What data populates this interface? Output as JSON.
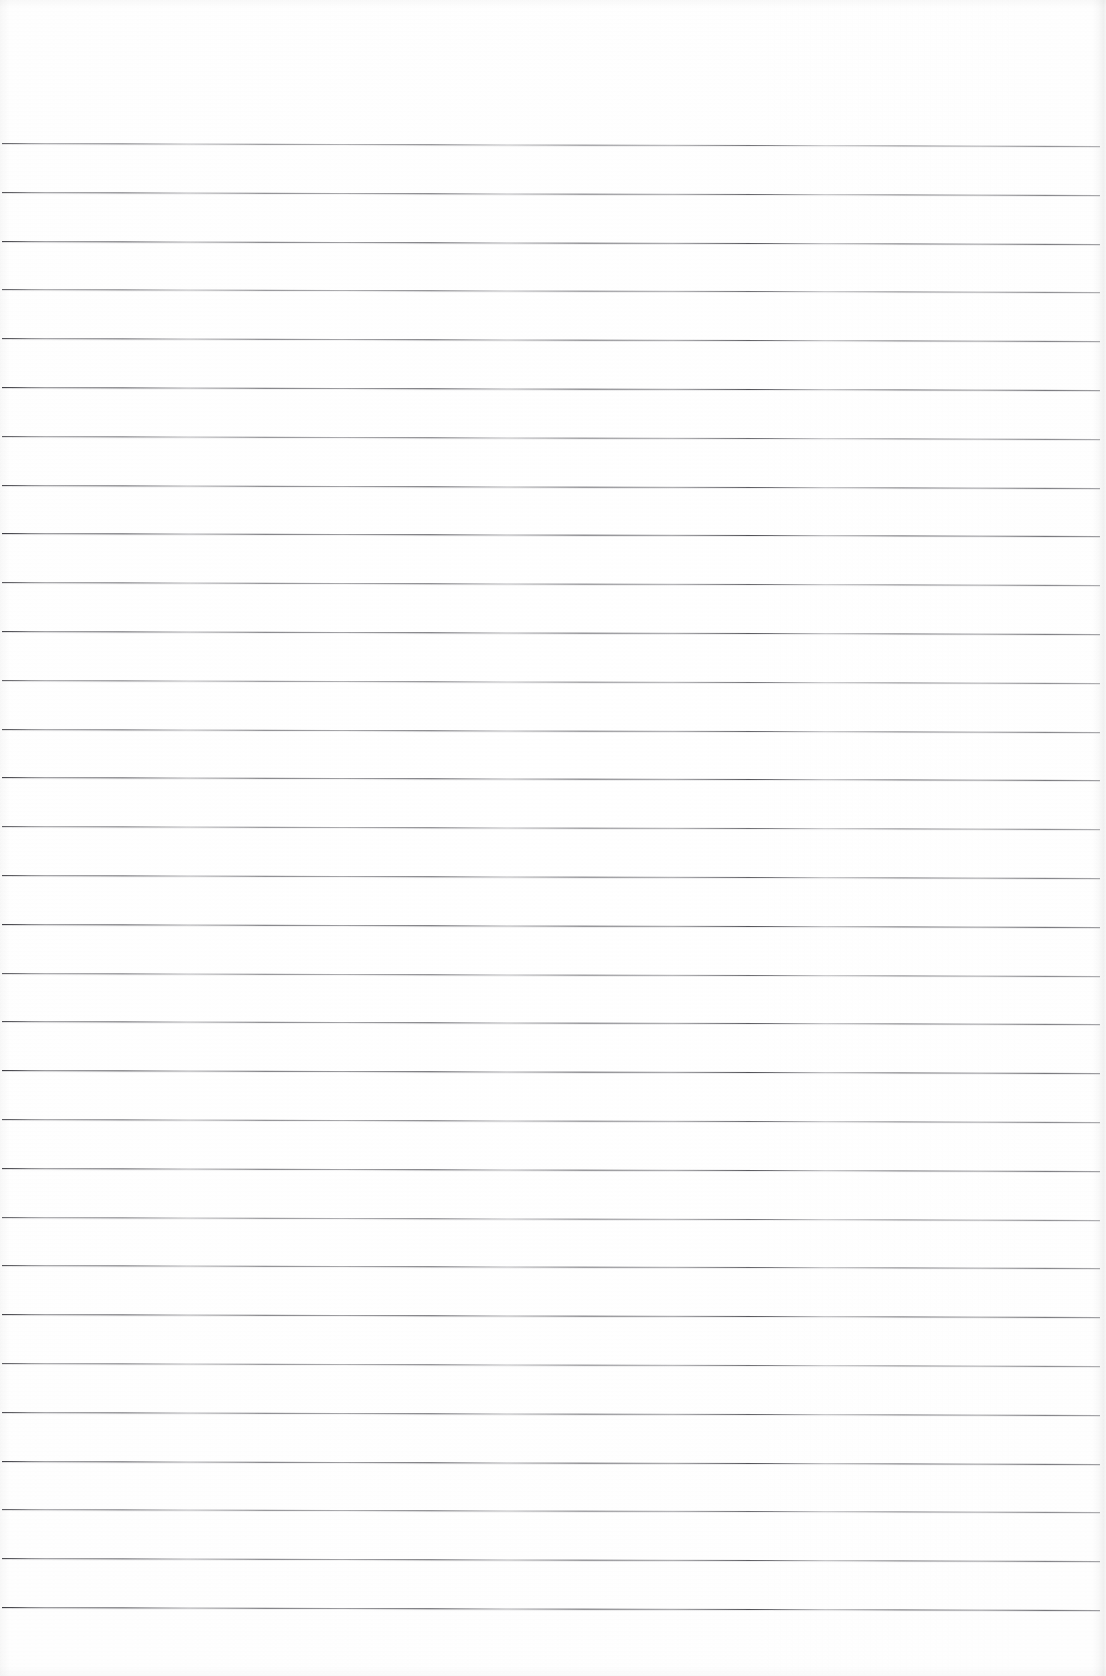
{
  "document": {
    "kind": "scanned-page",
    "title": "Blank ruled notebook page",
    "content_type": "lined-paper",
    "has_handwriting": false,
    "has_printed_text": false,
    "visible_text": "",
    "orientation": "portrait"
  },
  "page": {
    "width": 1106,
    "height": 1676,
    "background_color": "#fdfdfd",
    "paper_tone": "#ffffff"
  },
  "ruling": {
    "style": "wide-ruled horizontal lines",
    "line_color": "#4a4a50",
    "line_count": 31,
    "first_line_y": 143,
    "line_spacing": 48.8,
    "line_start_x": 2,
    "line_end_x": 1100,
    "stroke_thickness_px": 1,
    "slope_px_across_page": 3,
    "margin_rule_present": false,
    "holes_present": false,
    "line_positions_y": [
      143,
      192,
      241,
      289,
      338,
      387,
      436,
      485,
      533,
      582,
      631,
      680,
      729,
      777,
      826,
      875,
      924,
      973,
      1021,
      1070,
      1119,
      1168,
      1217,
      1265,
      1314,
      1363,
      1412,
      1461,
      1509,
      1558,
      1607
    ]
  },
  "scan_artifacts": {
    "right_edge_shadow": true,
    "left_edge_shadow": true,
    "top_edge_shadow": true,
    "bottom_edge_shadow": true,
    "paper_grain": true,
    "vignette": true,
    "edge_shadow_color": "#000000"
  }
}
